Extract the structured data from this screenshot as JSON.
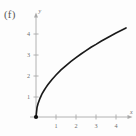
{
  "figure": {
    "part_label": "(f)",
    "background_color": "#fdfdfd",
    "axis_color": "#a9a9a9",
    "curve_color": "#1a1a1a"
  },
  "chart_data": {
    "type": "line",
    "title": "",
    "subtitle": "",
    "xlabel": "x",
    "ylabel": "y",
    "xlim": [
      -0.45,
      4.9
    ],
    "ylim": [
      -0.35,
      4.95
    ],
    "grid": false,
    "legend": false,
    "xticks": [
      1,
      2,
      3,
      4
    ],
    "xtick_labels": [
      "1",
      "2",
      "3",
      "4"
    ],
    "yticks": [
      1,
      2,
      3,
      4
    ],
    "ytick_labels": [
      "1",
      "2",
      "3",
      "4"
    ],
    "annotations": [],
    "series": [
      {
        "name": "y = 2*sqrt(x)",
        "x": [
          0,
          0.05,
          0.1,
          0.2,
          0.3,
          0.4,
          0.5,
          0.6,
          0.8,
          1.0,
          1.25,
          1.5,
          1.75,
          2.0,
          2.25,
          2.5,
          2.75,
          3.0,
          3.25,
          3.5,
          3.75,
          4.0,
          4.25,
          4.5
        ],
        "values": [
          0,
          0.45,
          0.63,
          0.89,
          1.1,
          1.26,
          1.41,
          1.55,
          1.79,
          2.0,
          2.24,
          2.45,
          2.65,
          2.83,
          3.0,
          3.16,
          3.32,
          3.46,
          3.61,
          3.74,
          3.87,
          4.0,
          4.12,
          4.24
        ]
      }
    ],
    "markers": [
      {
        "name": "origin-point",
        "x": 0,
        "y": 0,
        "style": "filled-dot"
      }
    ]
  }
}
